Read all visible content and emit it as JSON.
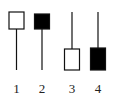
{
  "diagram": {
    "type": "candlestick-patterns",
    "colors": {
      "stroke": "#111111",
      "hollow_fill": "#ffffff",
      "filled_fill": "#000000",
      "label": "#222222"
    },
    "candles": [
      {
        "label": "1",
        "body": "hollow",
        "body_position": "top",
        "wick": "lower"
      },
      {
        "label": "2",
        "body": "filled",
        "body_position": "top",
        "wick": "lower"
      },
      {
        "label": "3",
        "body": "hollow",
        "body_position": "bottom",
        "wick": "upper"
      },
      {
        "label": "4",
        "body": "filled",
        "body_position": "bottom",
        "wick": "upper"
      }
    ]
  }
}
